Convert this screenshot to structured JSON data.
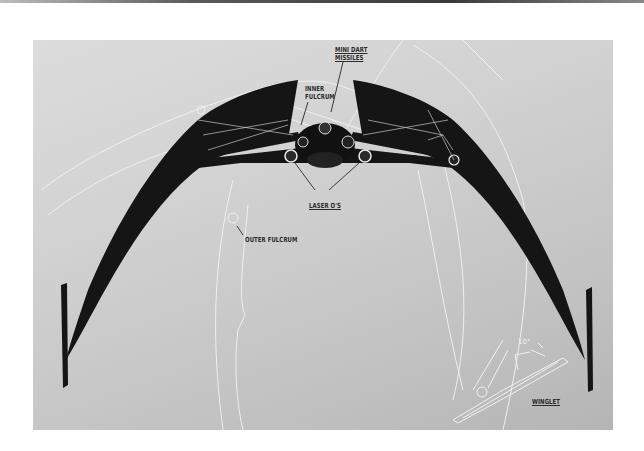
{
  "diagram": {
    "type": "spacecraft-concept-annotation",
    "background_colors": {
      "light": "#dcdcdc",
      "dark": "#b5b5b5"
    },
    "ship_color": "#151515",
    "annotation_color": "#f2f2f2",
    "labels": {
      "mini_dart_missiles_line1": "MINI DART",
      "mini_dart_missiles_line2": "MISSILES",
      "inner_fulcrum_line1": "INNER",
      "inner_fulcrum_line2": "FULCRUM",
      "laser_os": "LASER O'S",
      "outer_fulcrum": "OUTER FULCRUM",
      "winglet": "WINGLET",
      "winglet_angle": "10°"
    }
  }
}
